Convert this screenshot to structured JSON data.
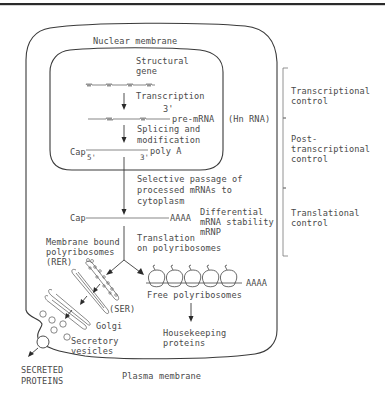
{
  "figure": {
    "labels": {
      "nuclear_membrane": "Nuclear membrane",
      "structural_gene_1": "Structural",
      "structural_gene_2": "gene",
      "transcription": "Transcription",
      "three_prime_top": "3'",
      "pre_mrna": "pre-mRNA",
      "hn_rna": "(Hn RNA)",
      "splicing_1": "Splicing and",
      "splicing_2": "modification",
      "cap_nuclear": "Cap",
      "five_prime": "5'",
      "three_prime": "3'",
      "poly_a": "poly A",
      "selective_1": "Selective passage of",
      "selective_2": "processed mRNAs to",
      "selective_3": "cytoplasm",
      "cap_cyto": "Cap",
      "aaaa_cyto": "AAAA",
      "differential_1": "Differential",
      "differential_2": "mRNA stability",
      "differential_3": "mRNP",
      "translation_1": "Translation",
      "translation_2": "on polyribosomes",
      "membrane_bound_1": "Membrane bound",
      "membrane_bound_2": "polyribosomes",
      "membrane_bound_3": "(RER)",
      "ser": "(SER)",
      "golgi": "Golgi",
      "secretory_1": "Secretory",
      "secretory_2": "vesicles",
      "free_polyribosomes": "Free polyribosomes",
      "aaaa_free": "AAAA",
      "housekeeping_1": "Housekeeping",
      "housekeeping_2": "proteins",
      "secreted_1": "SECRETED",
      "secreted_2": "PROTEINS",
      "plasma_membrane": "Plasma membrane"
    },
    "control_levels": [
      {
        "line1": "Transcriptional",
        "line2": "control"
      },
      {
        "line1": "Post-",
        "line2": "transcriptional",
        "line3": "control"
      },
      {
        "line1": "Translational",
        "line2": "control"
      }
    ],
    "colors": {
      "ink": "#3a3a3a",
      "text": "#4a4a4a",
      "background": "#ffffff"
    }
  }
}
